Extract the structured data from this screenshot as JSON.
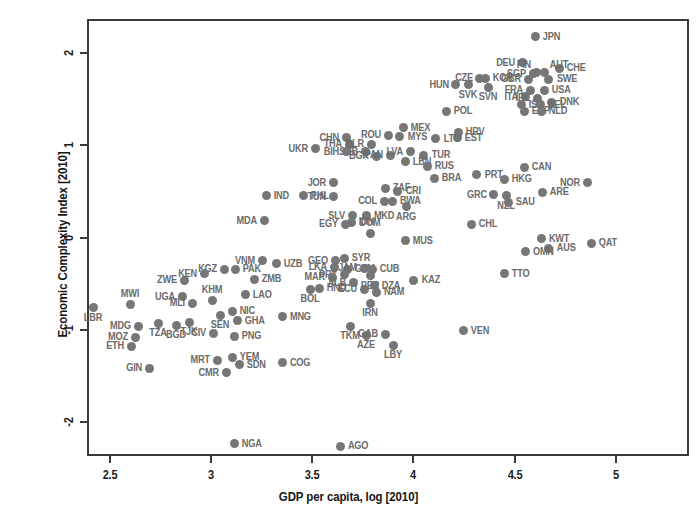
{
  "chart_data": {
    "type": "scatter",
    "title": "",
    "xlabel": "GDP per capita, log [2010]",
    "ylabel": "Economic Complexity Index [2010]",
    "xlim": [
      2.385,
      5.363
    ],
    "ylim": [
      -2.369,
      2.369
    ],
    "xticks": [
      "2.5",
      "3",
      "3.5",
      "4",
      "4.5",
      "5"
    ],
    "xtick_values": [
      2.5,
      3,
      3.5,
      4,
      4.5,
      5
    ],
    "yticks": [
      "2",
      "1",
      "0",
      "-1",
      "-2"
    ],
    "ytick_values": [
      2,
      1,
      0,
      -1,
      -2
    ],
    "grid": false,
    "legend": "none",
    "marker_color": "#767676",
    "label_color": "#6b6b6b",
    "axis_color": "#3a3a3a",
    "point_count": 128,
    "label_field": "country_iso3",
    "points": [
      {
        "label": "JPN",
        "x": 4.603,
        "y": 2.179,
        "lp": "right"
      },
      {
        "label": "DEU",
        "x": 4.539,
        "y": 1.893,
        "lp": "left"
      },
      {
        "label": "CHE",
        "x": 4.722,
        "y": 1.833,
        "lp": "right"
      },
      {
        "label": "SGP",
        "x": 4.593,
        "y": 1.774,
        "lp": "left"
      },
      {
        "label": "FIN",
        "x": 4.608,
        "y": 1.786,
        "lp": "leftup"
      },
      {
        "label": "AUT",
        "x": 4.648,
        "y": 1.786,
        "lp": "rightup"
      },
      {
        "label": "CZE",
        "x": 4.327,
        "y": 1.726,
        "lp": "left"
      },
      {
        "label": "KOR",
        "x": 4.356,
        "y": 1.726,
        "lp": "right"
      },
      {
        "label": "GBR",
        "x": 4.568,
        "y": 1.714,
        "lp": "left"
      },
      {
        "label": "SWE",
        "x": 4.668,
        "y": 1.714,
        "lp": "right"
      },
      {
        "label": "SVK",
        "x": 4.272,
        "y": 1.655,
        "lp": "below"
      },
      {
        "label": "HUN",
        "x": 4.208,
        "y": 1.655,
        "lp": "left"
      },
      {
        "label": "FRA",
        "x": 4.578,
        "y": 1.595,
        "lp": "left"
      },
      {
        "label": "USA",
        "x": 4.648,
        "y": 1.595,
        "lp": "right"
      },
      {
        "label": "SVN",
        "x": 4.371,
        "y": 1.631,
        "lp": "below"
      },
      {
        "label": "ITA",
        "x": 4.554,
        "y": 1.524,
        "lp": "left"
      },
      {
        "label": "IRL",
        "x": 4.613,
        "y": 1.512,
        "lp": "left"
      },
      {
        "label": "DNK",
        "x": 4.683,
        "y": 1.464,
        "lp": "right"
      },
      {
        "label": "ISR",
        "x": 4.534,
        "y": 1.44,
        "lp": "right"
      },
      {
        "label": "BEL",
        "x": 4.628,
        "y": 1.44,
        "lp": "right"
      },
      {
        "label": "ESP",
        "x": 4.549,
        "y": 1.369,
        "lp": "right"
      },
      {
        "label": "NLD",
        "x": 4.633,
        "y": 1.369,
        "lp": "right"
      },
      {
        "label": "POL",
        "x": 4.163,
        "y": 1.369,
        "lp": "right"
      },
      {
        "label": "MEX",
        "x": 3.95,
        "y": 1.19,
        "lp": "right"
      },
      {
        "label": "HRV",
        "x": 4.222,
        "y": 1.143,
        "lp": "right"
      },
      {
        "label": "EST",
        "x": 4.217,
        "y": 1.083,
        "lp": "right"
      },
      {
        "label": "ROU",
        "x": 3.876,
        "y": 1.107,
        "lp": "left"
      },
      {
        "label": "MYS",
        "x": 3.931,
        "y": 1.095,
        "lp": "right"
      },
      {
        "label": "LTU",
        "x": 4.109,
        "y": 1.071,
        "lp": "right"
      },
      {
        "label": "CHN",
        "x": 3.668,
        "y": 1.083,
        "lp": "left"
      },
      {
        "label": "THA",
        "x": 3.683,
        "y": 1.012,
        "lp": "left"
      },
      {
        "label": "BLR",
        "x": 3.792,
        "y": 1.012,
        "lp": "left"
      },
      {
        "label": "UKR",
        "x": 3.515,
        "y": 0.964,
        "lp": "left"
      },
      {
        "label": "SRB",
        "x": 3.762,
        "y": 0.929,
        "lp": "left"
      },
      {
        "label": "BIH",
        "x": 3.668,
        "y": 0.929,
        "lp": "left"
      },
      {
        "label": "BGR",
        "x": 3.817,
        "y": 0.881,
        "lp": "left"
      },
      {
        "label": "PAN",
        "x": 3.886,
        "y": 0.893,
        "lp": "left"
      },
      {
        "label": "LVA",
        "x": 3.985,
        "y": 0.929,
        "lp": "left"
      },
      {
        "label": "TUR",
        "x": 4.05,
        "y": 0.893,
        "lp": "right"
      },
      {
        "label": "LBN",
        "x": 3.96,
        "y": 0.821,
        "lp": "right"
      },
      {
        "label": "RUS",
        "x": 4.069,
        "y": 0.774,
        "lp": "right"
      },
      {
        "label": "CAN",
        "x": 4.549,
        "y": 0.762,
        "lp": "right"
      },
      {
        "label": "PRT",
        "x": 4.312,
        "y": 0.679,
        "lp": "right"
      },
      {
        "label": "HKG",
        "x": 4.45,
        "y": 0.631,
        "lp": "right"
      },
      {
        "label": "NOR",
        "x": 4.86,
        "y": 0.595,
        "lp": "left"
      },
      {
        "label": "BRA",
        "x": 4.104,
        "y": 0.643,
        "lp": "right"
      },
      {
        "label": "JOR",
        "x": 3.604,
        "y": 0.595,
        "lp": "left"
      },
      {
        "label": "ZAF",
        "x": 3.861,
        "y": 0.536,
        "lp": "right"
      },
      {
        "label": "CRI",
        "x": 3.921,
        "y": 0.5,
        "lp": "right"
      },
      {
        "label": "ARE",
        "x": 4.638,
        "y": 0.488,
        "lp": "right"
      },
      {
        "label": "GRC",
        "x": 4.396,
        "y": 0.464,
        "lp": "left"
      },
      {
        "label": "NZL",
        "x": 4.46,
        "y": 0.452,
        "lp": "below"
      },
      {
        "label": "TUN",
        "x": 3.604,
        "y": 0.44,
        "lp": "left"
      },
      {
        "label": "PHL",
        "x": 3.455,
        "y": 0.452,
        "lp": "right"
      },
      {
        "label": "IND",
        "x": 3.272,
        "y": 0.452,
        "lp": "right"
      },
      {
        "label": "COL",
        "x": 3.856,
        "y": 0.393,
        "lp": "left"
      },
      {
        "label": "BWA",
        "x": 3.896,
        "y": 0.393,
        "lp": "right"
      },
      {
        "label": "ARG",
        "x": 3.965,
        "y": 0.333,
        "lp": "below"
      },
      {
        "label": "SAU",
        "x": 4.47,
        "y": 0.381,
        "lp": "right"
      },
      {
        "label": "SLV",
        "x": 3.698,
        "y": 0.238,
        "lp": "left"
      },
      {
        "label": "MKD",
        "x": 3.767,
        "y": 0.238,
        "lp": "right"
      },
      {
        "label": "MDA",
        "x": 3.262,
        "y": 0.179,
        "lp": "left"
      },
      {
        "label": "EGY",
        "x": 3.663,
        "y": 0.143,
        "lp": "left"
      },
      {
        "label": "IDN",
        "x": 3.693,
        "y": 0.167,
        "lp": "right"
      },
      {
        "label": "CHL",
        "x": 4.287,
        "y": 0.143,
        "lp": "right"
      },
      {
        "label": "KWT",
        "x": 4.633,
        "y": -0.012,
        "lp": "right"
      },
      {
        "label": "QAT",
        "x": 4.88,
        "y": -0.06,
        "lp": "right"
      },
      {
        "label": "AUS",
        "x": 4.668,
        "y": -0.119,
        "lp": "right"
      },
      {
        "label": "OMN",
        "x": 4.554,
        "y": -0.155,
        "lp": "right"
      },
      {
        "label": "DOM",
        "x": 3.787,
        "y": 0.048,
        "lp": "above"
      },
      {
        "label": "MUS",
        "x": 3.96,
        "y": -0.036,
        "lp": "right"
      },
      {
        "label": "VNM",
        "x": 3.252,
        "y": -0.25,
        "lp": "left"
      },
      {
        "label": "GEO",
        "x": 3.614,
        "y": -0.25,
        "lp": "left"
      },
      {
        "label": "SYR",
        "x": 3.658,
        "y": -0.226,
        "lp": "right"
      },
      {
        "label": "UZB",
        "x": 3.322,
        "y": -0.286,
        "lp": "right"
      },
      {
        "label": "LKA",
        "x": 3.609,
        "y": -0.321,
        "lp": "left"
      },
      {
        "label": "GTM",
        "x": 3.673,
        "y": -0.345,
        "lp": "right"
      },
      {
        "label": "JAM",
        "x": 3.757,
        "y": -0.333,
        "lp": "left"
      },
      {
        "label": "CUB",
        "x": 3.797,
        "y": -0.345,
        "lp": "right"
      },
      {
        "label": "KGZ",
        "x": 3.064,
        "y": -0.345,
        "lp": "left"
      },
      {
        "label": "PAK",
        "x": 3.119,
        "y": -0.345,
        "lp": "right"
      },
      {
        "label": "PRY",
        "x": 3.658,
        "y": -0.405,
        "lp": "left"
      },
      {
        "label": "MAR",
        "x": 3.599,
        "y": -0.429,
        "lp": "left"
      },
      {
        "label": "PER",
        "x": 3.787,
        "y": -0.417,
        "lp": "below"
      },
      {
        "label": "TTO",
        "x": 4.45,
        "y": -0.393,
        "lp": "right"
      },
      {
        "label": "KAZ",
        "x": 4.001,
        "y": -0.464,
        "lp": "right"
      },
      {
        "label": "ZWE",
        "x": 2.866,
        "y": -0.464,
        "lp": "left"
      },
      {
        "label": "KEN",
        "x": 2.965,
        "y": -0.393,
        "lp": "left"
      },
      {
        "label": "ZMB",
        "x": 3.213,
        "y": -0.452,
        "lp": "right"
      },
      {
        "label": "ALB",
        "x": 3.703,
        "y": -0.488,
        "lp": "left"
      },
      {
        "label": "ECU",
        "x": 3.757,
        "y": -0.56,
        "lp": "left"
      },
      {
        "label": "DZA",
        "x": 3.807,
        "y": -0.524,
        "lp": "right"
      },
      {
        "label": "NAM",
        "x": 3.817,
        "y": -0.595,
        "lp": "right"
      },
      {
        "label": "HND",
        "x": 3.534,
        "y": -0.548,
        "lp": "right"
      },
      {
        "label": "BOL",
        "x": 3.49,
        "y": -0.56,
        "lp": "below"
      },
      {
        "label": "UGA",
        "x": 2.856,
        "y": -0.643,
        "lp": "left"
      },
      {
        "label": "MLI",
        "x": 2.906,
        "y": -0.714,
        "lp": "left"
      },
      {
        "label": "LAO",
        "x": 3.168,
        "y": -0.619,
        "lp": "right"
      },
      {
        "label": "KHM",
        "x": 3.005,
        "y": -0.679,
        "lp": "above"
      },
      {
        "label": "MWI",
        "x": 2.599,
        "y": -0.726,
        "lp": "above"
      },
      {
        "label": "LBR",
        "x": 2.416,
        "y": -0.762,
        "lp": "below"
      },
      {
        "label": "IRN",
        "x": 3.787,
        "y": -0.714,
        "lp": "below"
      },
      {
        "label": "MNG",
        "x": 3.351,
        "y": -0.857,
        "lp": "right"
      },
      {
        "label": "NIC",
        "x": 3.104,
        "y": -0.798,
        "lp": "right"
      },
      {
        "label": "SEN",
        "x": 3.045,
        "y": -0.845,
        "lp": "below"
      },
      {
        "label": "GHA",
        "x": 3.129,
        "y": -0.905,
        "lp": "right"
      },
      {
        "label": "TZA",
        "x": 2.737,
        "y": -0.929,
        "lp": "below"
      },
      {
        "label": "BGD",
        "x": 2.826,
        "y": -0.952,
        "lp": "below"
      },
      {
        "label": "TJK",
        "x": 2.891,
        "y": -0.917,
        "lp": "below"
      },
      {
        "label": "MDG",
        "x": 2.639,
        "y": -0.964,
        "lp": "left"
      },
      {
        "label": "TKM",
        "x": 3.688,
        "y": -0.964,
        "lp": "below"
      },
      {
        "label": "AZE",
        "x": 3.767,
        "y": -1.06,
        "lp": "below"
      },
      {
        "label": "GAB",
        "x": 3.861,
        "y": -1.048,
        "lp": "left"
      },
      {
        "label": "VEN",
        "x": 4.247,
        "y": -1.012,
        "lp": "right"
      },
      {
        "label": "CIV",
        "x": 3.01,
        "y": -1.036,
        "lp": "left"
      },
      {
        "label": "PNG",
        "x": 3.114,
        "y": -1.071,
        "lp": "right"
      },
      {
        "label": "MOZ",
        "x": 2.624,
        "y": -1.083,
        "lp": "left"
      },
      {
        "label": "LBY",
        "x": 3.901,
        "y": -1.167,
        "lp": "below"
      },
      {
        "label": "ETH",
        "x": 2.604,
        "y": -1.179,
        "lp": "left"
      },
      {
        "label": "MRT",
        "x": 3.03,
        "y": -1.333,
        "lp": "left"
      },
      {
        "label": "YEM",
        "x": 3.104,
        "y": -1.298,
        "lp": "right"
      },
      {
        "label": "COG",
        "x": 3.351,
        "y": -1.357,
        "lp": "right"
      },
      {
        "label": "SDN",
        "x": 3.139,
        "y": -1.381,
        "lp": "right"
      },
      {
        "label": "GIN",
        "x": 2.693,
        "y": -1.417,
        "lp": "left"
      },
      {
        "label": "CMR",
        "x": 3.074,
        "y": -1.464,
        "lp": "left"
      },
      {
        "label": "NGA",
        "x": 3.114,
        "y": -2.238,
        "lp": "right"
      },
      {
        "label": "AGO",
        "x": 3.638,
        "y": -2.262,
        "lp": "right"
      }
    ]
  }
}
